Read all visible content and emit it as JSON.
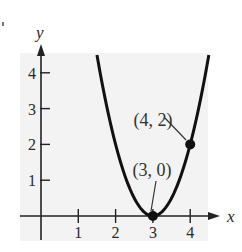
{
  "chart_data": {
    "type": "line",
    "title": "",
    "function": "y = 2(x - 3)^2",
    "xlabel": "x",
    "ylabel": "y",
    "x_ticks": [
      1,
      2,
      3,
      4
    ],
    "y_ticks": [
      1,
      2,
      3,
      4
    ],
    "xlim": [
      -0.5,
      4.9
    ],
    "ylim": [
      -0.6,
      4.7
    ],
    "grid": false,
    "legend": null,
    "background_color": "#f3f3f3",
    "curve_color": "#111111",
    "series": [
      {
        "name": "parabola",
        "x": [
          1.5,
          1.75,
          2.0,
          2.25,
          2.5,
          2.75,
          3.0,
          3.25,
          3.5,
          3.75,
          4.0,
          4.25,
          4.5
        ],
        "y": [
          4.5,
          3.125,
          2.0,
          1.125,
          0.5,
          0.125,
          0.0,
          0.125,
          0.5,
          1.125,
          2.0,
          3.125,
          4.5
        ]
      }
    ],
    "points": [
      {
        "x": 3,
        "y": 0,
        "label": "(3, 0)"
      },
      {
        "x": 4,
        "y": 2,
        "label": "(4, 2)"
      }
    ]
  }
}
